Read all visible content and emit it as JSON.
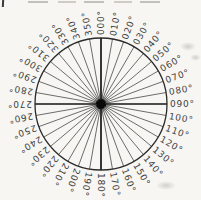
{
  "diagram": {
    "kind": "compass-rose-degree-wheel",
    "center": {
      "x": 101,
      "y": 104
    },
    "radius": 66,
    "label_radius": 69,
    "step_deg": 10,
    "labels": [
      "000°",
      "010°",
      "020°",
      "030°",
      "040°",
      "050°",
      "060°",
      "070°",
      "080°",
      "090°",
      "100°",
      "110°",
      "120°",
      "130°",
      "140°",
      "150°",
      "160°",
      "170°",
      "180°",
      "190°",
      "200°",
      "210°",
      "220°",
      "230°",
      "240°",
      "250°",
      "260°",
      "270°",
      "280°",
      "290°",
      "300°",
      "310°",
      "320°",
      "330°",
      "340°",
      "350°"
    ],
    "cardinal_angles_deg": [
      0,
      90,
      180,
      270
    ],
    "colors": {
      "paper": "#f7f6f3",
      "spoke": "#3d3d3d",
      "cardinal": "#151515",
      "ring": "#2b2b2b",
      "label": "#3f3f3f",
      "hub": "#0a0a0a"
    }
  }
}
